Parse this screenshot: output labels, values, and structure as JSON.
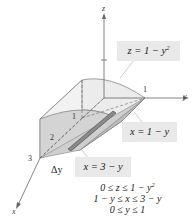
{
  "diagram": {
    "type": "3d-solid-region",
    "axes": {
      "x_label": "x",
      "y_label": "y",
      "z_label": "z",
      "x_ticks": [
        "1",
        "2",
        "3"
      ],
      "y_ticks": [
        "1"
      ],
      "z_ticks": [
        "1"
      ]
    },
    "surface_labels": {
      "top": "z = 1 − y",
      "top_exp": "2",
      "back": "x = 1 − y",
      "front": "x = 3 − y"
    },
    "slice_label": "Δy",
    "inequalities": {
      "z": {
        "text": "0 ≤ z ≤ 1 − y",
        "exp": "2"
      },
      "x": "1 − y ≤ x ≤ 3 − y",
      "y": "0 ≤ y ≤ 1"
    },
    "colors": {
      "solid_light": "#ececec",
      "solid_mid": "#d6d6d6",
      "solid_dark": "#bdbdbd",
      "label_bg": "#e9e9e9",
      "slice": "#7a7a7a"
    }
  }
}
